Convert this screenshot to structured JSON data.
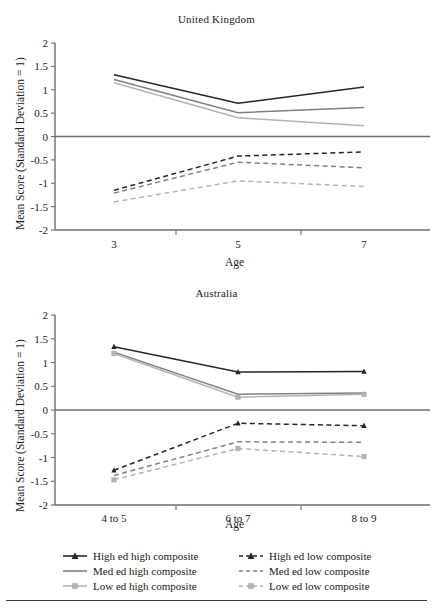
{
  "figure": {
    "y_axis_label": "Mean Score (Standard Deviation = 1)",
    "x_axis_title": "Age",
    "y_ticks": [
      "2",
      "1.5",
      "1",
      "0.5",
      "0",
      "-0.5",
      "-1",
      "-1.5",
      "-2"
    ]
  },
  "legend": {
    "items_left": [
      {
        "label": "High ed high composite",
        "key": "solid-triangle-dark",
        "color": "#262626",
        "dash": "solid",
        "marker": "triangle"
      },
      {
        "label": "Med ed high composite",
        "key": "solid-line-mid",
        "color": "#808080",
        "dash": "solid",
        "marker": "none"
      },
      {
        "label": "Low ed high composite",
        "key": "solid-square-light",
        "color": "#b3b3b3",
        "dash": "solid",
        "marker": "square"
      }
    ],
    "items_right": [
      {
        "label": "High ed low composite",
        "key": "dashed-triangle-dark",
        "color": "#262626",
        "dash": "dashed",
        "marker": "triangle"
      },
      {
        "label": "Med ed low composite",
        "key": "dashed-line-mid",
        "color": "#808080",
        "dash": "dashed",
        "marker": "none"
      },
      {
        "label": "Low ed low composite",
        "key": "dashed-square-light",
        "color": "#b3b3b3",
        "dash": "dashed",
        "marker": "square"
      }
    ]
  },
  "chart_data": [
    {
      "id": "united-kingdom",
      "type": "line",
      "title": "United Kingdom",
      "xlabel": "Age",
      "ylabel": "Mean Score (Standard Deviation = 1)",
      "categories": [
        "3",
        "5",
        "7"
      ],
      "ylim": [
        -2,
        2
      ],
      "ytick_step": 0.5,
      "grid": false,
      "markers": false,
      "legend_position": "below-figure",
      "series": [
        {
          "name": "High ed high composite",
          "values": [
            1.32,
            0.71,
            1.06
          ],
          "color": "#262626",
          "dash": "solid",
          "marker": "none"
        },
        {
          "name": "Med ed high composite",
          "values": [
            1.22,
            0.51,
            0.62
          ],
          "color": "#808080",
          "dash": "solid",
          "marker": "none"
        },
        {
          "name": "Low ed high composite",
          "values": [
            1.15,
            0.4,
            0.23
          ],
          "color": "#b3b3b3",
          "dash": "solid",
          "marker": "none"
        },
        {
          "name": "High ed low composite",
          "values": [
            -1.15,
            -0.42,
            -0.33
          ],
          "color": "#262626",
          "dash": "dashed",
          "marker": "none"
        },
        {
          "name": "Med ed low composite",
          "values": [
            -1.21,
            -0.55,
            -0.67
          ],
          "color": "#808080",
          "dash": "dashed",
          "marker": "none"
        },
        {
          "name": "Low ed low composite",
          "values": [
            -1.4,
            -0.95,
            -1.07
          ],
          "color": "#b3b3b3",
          "dash": "dashed",
          "marker": "none"
        }
      ]
    },
    {
      "id": "australia",
      "type": "line",
      "title": "Australia",
      "xlabel": "Age",
      "ylabel": "Mean Score (Standard Deviation = 1)",
      "categories": [
        "4 to 5",
        "6 to 7",
        "8 to 9"
      ],
      "ylim": [
        -2,
        2
      ],
      "ytick_step": 0.5,
      "grid": false,
      "markers": true,
      "legend_position": "below-figure",
      "series": [
        {
          "name": "High ed high composite",
          "values": [
            1.33,
            0.8,
            0.81
          ],
          "color": "#262626",
          "dash": "solid",
          "marker": "triangle"
        },
        {
          "name": "Med ed high composite",
          "values": [
            1.22,
            0.33,
            0.36
          ],
          "color": "#808080",
          "dash": "solid",
          "marker": "none"
        },
        {
          "name": "Low ed high composite",
          "values": [
            1.19,
            0.27,
            0.33
          ],
          "color": "#b3b3b3",
          "dash": "solid",
          "marker": "square"
        },
        {
          "name": "High ed low composite",
          "values": [
            -1.27,
            -0.28,
            -0.33
          ],
          "color": "#262626",
          "dash": "dashed",
          "marker": "triangle"
        },
        {
          "name": "Med ed low composite",
          "values": [
            -1.38,
            -0.67,
            -0.68
          ],
          "color": "#808080",
          "dash": "dashed",
          "marker": "none"
        },
        {
          "name": "Low ed low composite",
          "values": [
            -1.47,
            -0.81,
            -0.98
          ],
          "color": "#b3b3b3",
          "dash": "dashed",
          "marker": "square"
        }
      ]
    }
  ]
}
